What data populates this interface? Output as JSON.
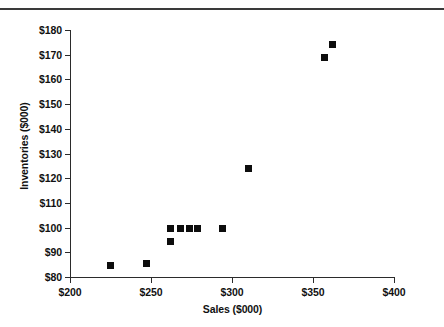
{
  "chart_data": {
    "type": "scatter",
    "title": "",
    "xlabel": "Sales ($000)",
    "ylabel": "Inventories ($000)",
    "xlim": [
      200,
      400
    ],
    "ylim": [
      80,
      180
    ],
    "grid": false,
    "legend": "none",
    "marker_style": "filled-square",
    "marker_color": "#0d0d0d",
    "x_ticks": [
      200,
      250,
      300,
      350,
      400
    ],
    "x_tick_labels": [
      "$200",
      "$250",
      "$300",
      "$350",
      "$400"
    ],
    "y_ticks": [
      80,
      90,
      100,
      110,
      120,
      130,
      140,
      150,
      160,
      170,
      180
    ],
    "y_tick_labels": [
      "$80",
      "$90",
      "$100",
      "$110",
      "$120",
      "$130",
      "$140",
      "$150",
      "$160",
      "$170",
      "$180"
    ],
    "points": [
      {
        "x": 225,
        "y": 84.5
      },
      {
        "x": 247,
        "y": 85.5
      },
      {
        "x": 262,
        "y": 99.5
      },
      {
        "x": 262,
        "y": 94.5
      },
      {
        "x": 268,
        "y": 99.5
      },
      {
        "x": 274,
        "y": 99.5
      },
      {
        "x": 279,
        "y": 99.5
      },
      {
        "x": 294,
        "y": 99.5
      },
      {
        "x": 310,
        "y": 124
      },
      {
        "x": 357,
        "y": 169
      },
      {
        "x": 362,
        "y": 174
      }
    ]
  }
}
